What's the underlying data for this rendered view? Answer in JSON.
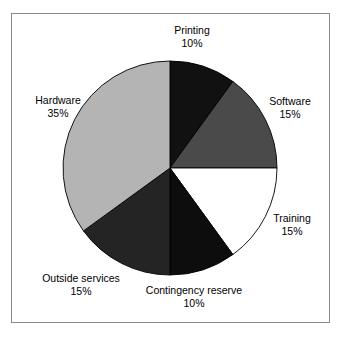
{
  "figure": {
    "background_color": "#ffffff",
    "frame_color": "#8a8a8a"
  },
  "chart_data": {
    "type": "pie",
    "title": "",
    "subtitle": "",
    "xlabel": "",
    "ylabel": "",
    "legend_position": "none",
    "grid": false,
    "start_angle_deg": 90,
    "direction": "clockwise",
    "units": "percent",
    "total": 100,
    "categories": [
      "Printing",
      "Software",
      "Training",
      "Contingency reserve",
      "Outside services",
      "Hardware"
    ],
    "values": [
      10,
      15,
      15,
      10,
      15,
      35
    ],
    "labels": [
      "10%",
      "15%",
      "15%",
      "10%",
      "15%",
      "35%"
    ],
    "colors": [
      "#111111",
      "#4a4a4a",
      "#ffffff",
      "#0d0d0d",
      "#242424",
      "#b4b4b4"
    ],
    "slice_edge_color": "#000000",
    "slices": [
      {
        "name": "Printing",
        "value": 10,
        "label": "10%",
        "color": "#111111"
      },
      {
        "name": "Software",
        "value": 15,
        "label": "15%",
        "color": "#4a4a4a"
      },
      {
        "name": "Training",
        "value": 15,
        "label": "15%",
        "color": "#ffffff"
      },
      {
        "name": "Contingency reserve",
        "value": 10,
        "label": "10%",
        "color": "#0d0d0d"
      },
      {
        "name": "Outside services",
        "value": 15,
        "label": "15%",
        "color": "#242424"
      },
      {
        "name": "Hardware",
        "value": 35,
        "label": "35%",
        "color": "#b4b4b4"
      }
    ]
  }
}
